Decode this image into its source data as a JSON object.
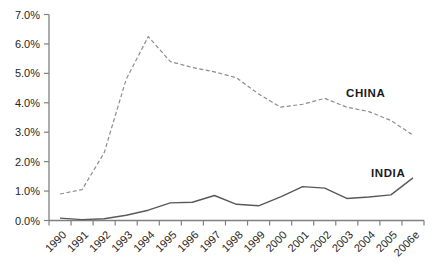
{
  "chart_data": {
    "type": "line",
    "title": "",
    "xlabel": "",
    "ylabel": "",
    "ylim": [
      0,
      7
    ],
    "grid": false,
    "legend": "inline-labels",
    "y_tick_labels": [
      "0.0%",
      "1.0%",
      "2.0%",
      "3.0%",
      "4.0%",
      "5.0%",
      "6.0%",
      "7.0%"
    ],
    "categories": [
      "1990",
      "1991",
      "1992",
      "1993",
      "1994",
      "1995",
      "1996",
      "1997",
      "1998",
      "1999",
      "2000",
      "2001",
      "2002",
      "2003",
      "2004",
      "2005",
      "2006e"
    ],
    "series": [
      {
        "name": "CHINA",
        "line_style": "dashed",
        "color": "#8c8c8c",
        "values": [
          0.9,
          1.05,
          2.3,
          4.8,
          6.25,
          5.4,
          5.2,
          5.05,
          4.85,
          4.3,
          3.85,
          3.95,
          4.15,
          3.85,
          3.7,
          3.4,
          2.9
        ]
      },
      {
        "name": "INDIA",
        "line_style": "solid",
        "color": "#595959",
        "values": [
          0.08,
          0.03,
          0.06,
          0.18,
          0.35,
          0.6,
          0.62,
          0.85,
          0.55,
          0.5,
          0.8,
          1.15,
          1.1,
          0.75,
          0.8,
          0.87,
          1.45
        ]
      }
    ],
    "colors": {
      "axis": "#808080",
      "tick_text": "#262626",
      "background": "#ffffff"
    }
  }
}
